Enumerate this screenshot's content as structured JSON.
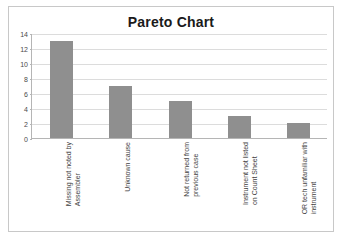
{
  "chart_data": {
    "type": "bar",
    "title": "Pareto Chart",
    "xlabel": "",
    "ylabel": "",
    "ylim": [
      0,
      14
    ],
    "grid": true,
    "legend": "none",
    "orientation": "vertical",
    "bar_color": "#8f8f8f",
    "categories": [
      "Missing not noted by Assembler",
      "Unknown cause",
      "Not returned from previous case",
      "Instrument not listed on Count Sheet",
      "OR tech unfamiliar with instrument"
    ],
    "category_lines": [
      [
        "Missing not noted by",
        "Assembler"
      ],
      [
        "Unknown cause",
        ""
      ],
      [
        "Not returned from",
        "previous case"
      ],
      [
        "Instrument not listed",
        "on Count Sheet"
      ],
      [
        "OR tech unfamiliar with",
        "instrument"
      ]
    ],
    "values": [
      13,
      7,
      5,
      3,
      2
    ],
    "yticks": [
      0,
      2,
      4,
      6,
      8,
      10,
      12,
      14
    ],
    "ytick_labels": [
      "0",
      "2",
      "4",
      "6",
      "8",
      "10",
      "12",
      "14"
    ]
  },
  "colors": {
    "bar": "#8f8f8f",
    "gridline": "#dcdcdc",
    "axis": "#b5b5b5",
    "border": "#c8c8c8",
    "title": "#1a1a1a",
    "tick_text": "#4a4a4a",
    "category_text": "#3f3f3f"
  }
}
